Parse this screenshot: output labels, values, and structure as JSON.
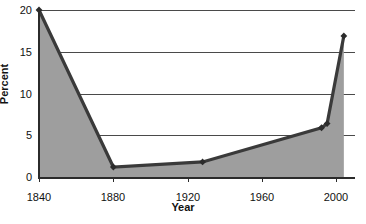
{
  "chart_data": {
    "type": "area",
    "title": "",
    "xlabel": "Year",
    "ylabel": "Percent",
    "xlim": [
      1840,
      2010
    ],
    "ylim": [
      0,
      20
    ],
    "grid": true,
    "legend": false,
    "x_ticks": [
      "1840",
      "1880",
      "1920",
      "1960",
      "2000"
    ],
    "x_tick_values": [
      1840,
      1880,
      1920,
      1960,
      2000
    ],
    "y_ticks": [
      "0",
      "5",
      "10",
      "15",
      "20"
    ],
    "y_tick_values": [
      0,
      5,
      10,
      15,
      20
    ],
    "x": [
      1840,
      1880,
      1928,
      1992,
      1995,
      2004
    ],
    "values": [
      20.0,
      1.2,
      1.8,
      5.9,
      6.4,
      16.9
    ],
    "points": [
      {
        "x": 1840,
        "y": 20.0
      },
      {
        "x": 1880,
        "y": 1.2
      },
      {
        "x": 1928,
        "y": 1.8
      },
      {
        "x": 1992,
        "y": 5.9
      },
      {
        "x": 1995,
        "y": 6.4
      },
      {
        "x": 2004,
        "y": 16.9
      }
    ],
    "marker": "diamond",
    "colors": {
      "line": "#3a3a3a",
      "fill": "#9e9e9e",
      "marker": "#2b2b2b",
      "grid": "#4a4a4a",
      "axis": "#2b2b2b",
      "text": "#111111",
      "background": "#ffffff"
    }
  }
}
